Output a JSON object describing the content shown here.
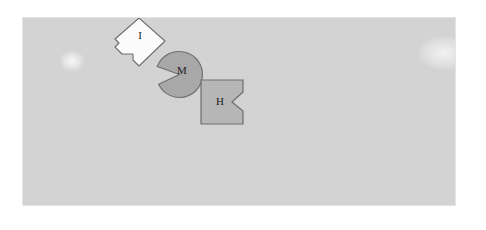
{
  "scene": {
    "width": 486,
    "height": 230,
    "background_color": "#ffffff",
    "canvas": {
      "label": "shape-canvas",
      "x": 22,
      "y": 17,
      "width": 434,
      "height": 189,
      "fill_color": "#d3d3d3",
      "border_color": "#e4e4e4"
    }
  },
  "shapes": [
    {
      "id": "shape-i",
      "label": "I",
      "form": "notched-diamond",
      "description": "diamond with a square notch cut from the lower-left edge",
      "fill_color": "#fbfbfb",
      "stroke_color": "#6e6e6e",
      "x": 112,
      "y": 17,
      "width": 55,
      "height": 47,
      "label_x": 139,
      "label_y": 36
    },
    {
      "id": "shape-m",
      "label": "M",
      "form": "notched-circle",
      "description": "circle with a triangular pac-man wedge removed on the left side",
      "fill_color": "#a8a8a8",
      "stroke_color": "#6e6e6e",
      "x": 155,
      "y": 50,
      "width": 47,
      "height": 47,
      "label_x": 179,
      "label_y": 70
    },
    {
      "id": "shape-h",
      "label": "H",
      "form": "notched-square",
      "description": "square with a V-shaped notch cut into the middle of the right edge",
      "fill_color": "#b6b6b6",
      "stroke_color": "#6e6e6e",
      "x": 200,
      "y": 79,
      "width": 44,
      "height": 45,
      "label_x": 219,
      "label_y": 98
    }
  ],
  "artifacts": [
    {
      "id": "smudge-left",
      "name": "faint-light-smudge"
    },
    {
      "id": "smudge-right",
      "name": "faint-light-smudge"
    }
  ]
}
